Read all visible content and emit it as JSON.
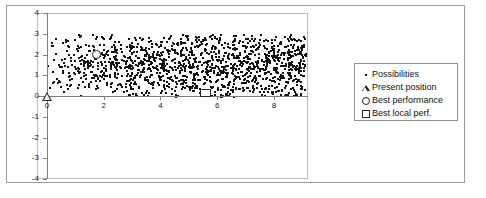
{
  "chart_data": {
    "type": "scatter",
    "title": "",
    "xlabel": "",
    "ylabel": "",
    "xlim": [
      -0.35,
      9.2
    ],
    "ylim": [
      -4,
      4
    ],
    "xticks": [
      0,
      2,
      4,
      6,
      8
    ],
    "yticks": [
      4,
      3,
      2,
      1,
      0,
      -1,
      -2,
      -3,
      -4
    ],
    "xtick_labels": [
      "0",
      "2",
      "4",
      "6",
      "8"
    ],
    "ytick_labels": [
      "4",
      "3",
      "2",
      "1",
      "0",
      "-1",
      "-2",
      "-3",
      "-4"
    ],
    "grid": false,
    "legend_position": "right-outside",
    "series": [
      {
        "name": "Possibilities",
        "marker": "dot",
        "note": "Dense cloud of ~1400 particle samples filling x from 0 to 9.1 and y from 0 to 3, density increasing toward larger x and concentrated between y=0.5 and y=2.9",
        "count": 1400,
        "x_range": [
          0.0,
          9.1
        ],
        "y_range": [
          0.0,
          3.0
        ]
      },
      {
        "name": "Present position",
        "marker": "triangle-open",
        "points": [
          {
            "x": 0.0,
            "y": 0.0
          }
        ]
      },
      {
        "name": "Best performance",
        "marker": "circle-open",
        "points": [
          {
            "x": 1.75,
            "y": 2.0
          }
        ]
      },
      {
        "name": "Best local perf.",
        "marker": "square-open",
        "points": [
          {
            "x": 5.6,
            "y": 0.15
          }
        ]
      }
    ]
  },
  "legend": {
    "entries": [
      {
        "label": "Possibilities",
        "marker": "dot-icon"
      },
      {
        "label": "Present position",
        "marker": "triangle-outline-icon"
      },
      {
        "label": "Best performance",
        "marker": "circle-outline-icon"
      },
      {
        "label": "Best local perf.",
        "marker": "square-outline-icon"
      }
    ]
  },
  "colors": {
    "point": "#111111",
    "axis": "#7d7d7d",
    "frame": "#b9b9b9",
    "figure_border": "#9a9a9a",
    "legend_border": "#8f8f8f",
    "background": "#ffffff"
  }
}
